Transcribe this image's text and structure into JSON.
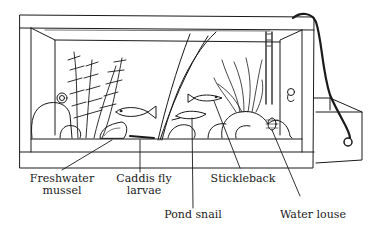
{
  "diagram": {
    "labels": [
      {
        "id": "freshwater-mussel",
        "line1": "Freshwater",
        "line2": "mussel"
      },
      {
        "id": "caddis-fly-larvae",
        "line1": "Caddis fly",
        "line2": "larvae"
      },
      {
        "id": "pond-snail",
        "line1": "Pond snail",
        "line2": ""
      },
      {
        "id": "stickleback",
        "line1": "Stickleback",
        "line2": ""
      },
      {
        "id": "water-louse",
        "line1": "Water louse",
        "line2": ""
      }
    ],
    "colors": {
      "ink": "#1a1a1a",
      "background": "#ffffff"
    }
  }
}
